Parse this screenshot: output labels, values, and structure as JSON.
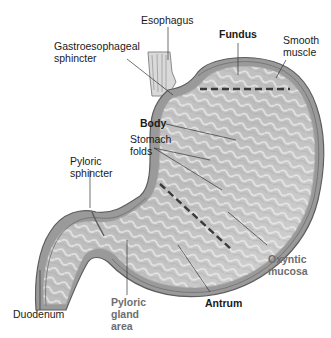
{
  "diagram": {
    "labels": {
      "esophagus": "Esophagus",
      "gastroesophageal_sphincter": "Gastroesophageal\nsphincter",
      "fundus": "Fundus",
      "smooth_muscle": "Smooth\nmuscle",
      "body": "Body",
      "stomach_folds": "Stomach\nfolds",
      "pyloric_sphincter": "Pyloric\nsphincter",
      "oxyntic_mucosa": "Oxyntic\nmucosa",
      "duodenum": "Duodenum",
      "pyloric_gland_area": "Pyloric\ngland\narea",
      "antrum": "Antrum"
    },
    "colors": {
      "label_text": "#1a1a1a",
      "region_label_text": "#6e6e6e",
      "wall_outer": "#8a8a8a",
      "wall_inner": "#bdbdbd",
      "mucosa": "#d2d2d2",
      "fold_highlight": "#ececec",
      "divider_dash": "#3a3a3a",
      "leader_line": "#333333"
    }
  }
}
